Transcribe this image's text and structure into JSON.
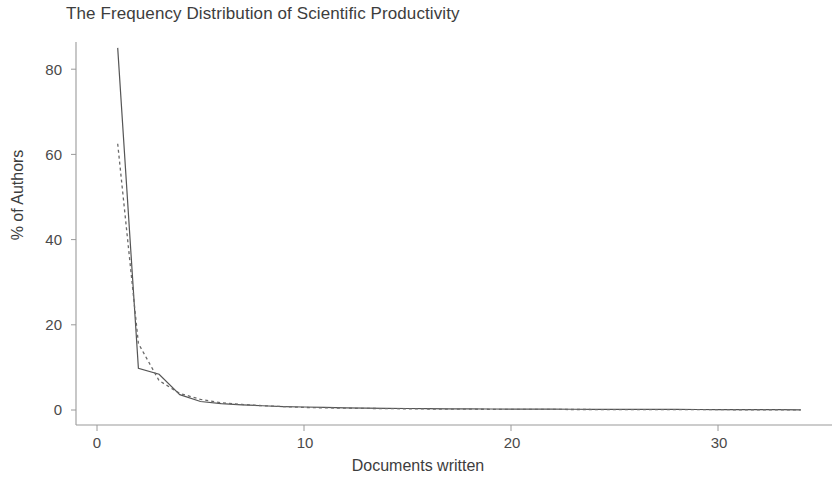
{
  "chart_data": {
    "type": "line",
    "title": "The Frequency Distribution of Scientific Productivity",
    "xlabel": "Documents written",
    "ylabel": "% of Authors",
    "xlim": [
      0,
      35
    ],
    "ylim": [
      0,
      88
    ],
    "grid": false,
    "legend": "none",
    "xticks": [
      0,
      10,
      20,
      30
    ],
    "xtick_labels": [
      "0",
      "10",
      "20",
      "30"
    ],
    "yticks": [
      0,
      20,
      40,
      60,
      80
    ],
    "ytick_labels": [
      "0",
      "20",
      "40",
      "60",
      "80"
    ],
    "x": [
      1,
      2,
      3,
      4,
      5,
      6,
      7,
      8,
      9,
      10,
      11,
      12,
      13,
      14,
      15,
      16,
      17,
      18,
      19,
      20,
      21,
      22,
      23,
      24,
      25,
      26,
      27,
      28,
      29,
      30,
      31,
      32,
      33,
      34
    ],
    "series": [
      {
        "name": "Observed",
        "style": "solid",
        "color": "#555555",
        "values": [
          85.0,
          9.8,
          8.4,
          3.6,
          2.0,
          1.5,
          1.2,
          1.0,
          0.8,
          0.7,
          0.6,
          0.5,
          0.45,
          0.4,
          0.35,
          0.3,
          0.28,
          0.26,
          0.24,
          0.22,
          0.2,
          0.19,
          0.18,
          0.17,
          0.16,
          0.15,
          0.14,
          0.13,
          0.12,
          0.11,
          0.1,
          0.09,
          0.08,
          0.05
        ]
      },
      {
        "name": "Expected (Lotka)",
        "style": "dashed",
        "color": "#6a6a6a",
        "values": [
          62.5,
          15.6,
          6.9,
          3.9,
          2.5,
          1.7,
          1.3,
          1.0,
          0.8,
          0.6,
          0.5,
          0.43,
          0.37,
          0.32,
          0.28,
          0.24,
          0.22,
          0.19,
          0.17,
          0.16,
          0.14,
          0.13,
          0.12,
          0.11,
          0.1,
          0.09,
          0.09,
          0.08,
          0.07,
          0.07,
          0.06,
          0.06,
          0.06,
          0.05
        ]
      }
    ]
  },
  "axes": {
    "line_color": "#9a9a9a",
    "text_color": "#3d3d3d"
  }
}
